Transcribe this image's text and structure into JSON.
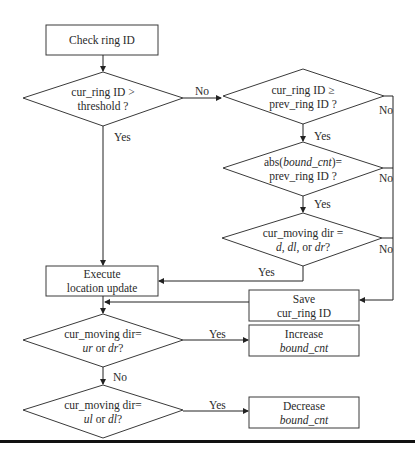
{
  "nodes": {
    "check": {
      "line1": "Check ring ID"
    },
    "d_threshold": {
      "line1": "cur_ring ID >",
      "line2": "threshold ?"
    },
    "d_prev": {
      "line1": "cur_ring ID ≥",
      "line2": "prev_ring ID ?"
    },
    "d_abs": {
      "line1_pre": "abs(",
      "line1_it": "bound_cnt",
      "line1_post": ")=",
      "line2": "prev_ring ID ?"
    },
    "d_dir1": {
      "line1": "cur_moving dir =",
      "line2_a": "d",
      "line2_b": ", ",
      "line2_c": "dl",
      "line2_d": ", or ",
      "line2_e": "dr",
      "line2_f": "?"
    },
    "execute": {
      "line1": "Execute",
      "line2": "location update"
    },
    "save": {
      "line1": "Save",
      "line2": "cur_ring ID"
    },
    "d_urdr": {
      "line1": "cur_moving dir=",
      "line2_a": "ur",
      "line2_b": " or ",
      "line2_c": "dr",
      "line2_d": "?"
    },
    "increase": {
      "line1": "Increase",
      "line2": "bound_cnt"
    },
    "d_uldl": {
      "line1": "cur_moving dir=",
      "line2_a": "ul",
      "line2_b": " or ",
      "line2_c": "dl",
      "line2_d": "?"
    },
    "decrease": {
      "line1": "Decrease",
      "line2": "bound_cnt"
    }
  },
  "edge_labels": {
    "threshold_no": "No",
    "threshold_yes": "Yes",
    "prev_yes": "Yes",
    "prev_no": "No",
    "abs_yes": "Yes",
    "abs_no": "No",
    "dir1_yes": "Yes",
    "dir1_no": "No",
    "urdr_yes": "Yes",
    "urdr_no": "No",
    "uldl_yes": "Yes"
  },
  "colors": {
    "stroke": "#3a3a3a",
    "text": "#2a2a2a",
    "rule": "#111111"
  }
}
